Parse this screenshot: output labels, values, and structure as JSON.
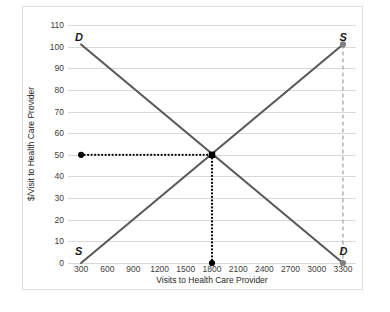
{
  "chart_data": {
    "type": "line",
    "title": "",
    "xlabel": "Visits to Health Care Provider",
    "ylabel": "$/Visit to Health Care Provider",
    "xlim": [
      150,
      3450
    ],
    "ylim": [
      0,
      110
    ],
    "grid": true,
    "legend": "none",
    "xticks": [
      300,
      600,
      900,
      1200,
      1500,
      1800,
      2100,
      2400,
      2700,
      3000,
      3300
    ],
    "yticks": [
      0,
      10,
      20,
      30,
      40,
      50,
      60,
      70,
      80,
      90,
      100,
      110
    ],
    "series": [
      {
        "name": "Demand",
        "label": "D",
        "color": "#595959",
        "style": "solid",
        "x": [
          300,
          3300
        ],
        "y": [
          101,
          0
        ]
      },
      {
        "name": "Supply",
        "label": "S",
        "color": "#595959",
        "style": "solid",
        "x": [
          300,
          3300
        ],
        "y": [
          0,
          101
        ]
      }
    ],
    "annotations": [
      {
        "name": "demand-label-top-left",
        "text": "D",
        "x": 300,
        "y": 104
      },
      {
        "name": "supply-label-bottom-left",
        "text": "S",
        "x": 300,
        "y": 5
      },
      {
        "name": "supply-label-top-right",
        "text": "S",
        "x": 3330,
        "y": 104
      },
      {
        "name": "demand-label-bottom-right",
        "text": "D",
        "x": 3330,
        "y": 5
      }
    ],
    "guides": [
      {
        "name": "equilibrium-price-guide",
        "style": "dotted",
        "color": "#000000",
        "from": {
          "x": 300,
          "y": 50
        },
        "to": {
          "x": 1800,
          "y": 50
        }
      },
      {
        "name": "equilibrium-quantity-guide",
        "style": "dotted",
        "color": "#000000",
        "from": {
          "x": 1800,
          "y": 50
        },
        "to": {
          "x": 1800,
          "y": 0
        }
      },
      {
        "name": "supply-capacity-line",
        "style": "dashed",
        "color": "#a6a6a6",
        "from": {
          "x": 3300,
          "y": 101
        },
        "to": {
          "x": 3300,
          "y": 0
        }
      }
    ],
    "markers": [
      {
        "name": "equilibrium-point",
        "shape": "square",
        "color": "#000000",
        "x": 1800,
        "y": 50
      },
      {
        "name": "price-axis-point",
        "shape": "circle",
        "color": "#000000",
        "x": 300,
        "y": 50
      },
      {
        "name": "quantity-axis-point",
        "shape": "circle",
        "color": "#000000",
        "x": 1800,
        "y": 0
      },
      {
        "name": "supply-endpoint",
        "shape": "circle",
        "color": "#808080",
        "x": 3300,
        "y": 101
      },
      {
        "name": "demand-endpoint",
        "shape": "circle",
        "color": "#808080",
        "x": 3300,
        "y": 0
      }
    ],
    "equilibrium": {
      "price": 50,
      "quantity": 1800
    }
  },
  "axis": {
    "y_tick_labels": [
      "110",
      "100",
      "90",
      "80",
      "70",
      "60",
      "50",
      "40",
      "30",
      "20",
      "10",
      "0"
    ],
    "x_tick_labels": [
      "300",
      "600",
      "900",
      "1200",
      "1500",
      "1800",
      "2100",
      "2400",
      "2700",
      "3000",
      "3300"
    ],
    "x_title": "Visits to Health Care Provider",
    "y_title": "$/Visit to Health Care Provider"
  },
  "labels": {
    "demand_top": "D",
    "supply_bottom": "S",
    "supply_top": "S",
    "demand_bottom": "D"
  }
}
